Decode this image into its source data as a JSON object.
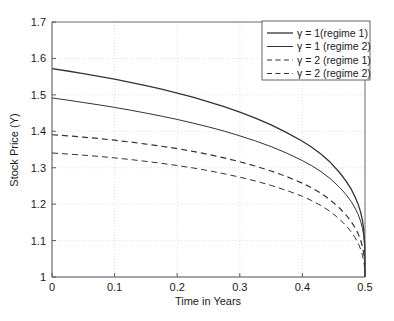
{
  "chart_data": {
    "type": "line",
    "title": "",
    "xlabel": "Time in Years",
    "ylabel": "Stock Price (Y)",
    "xlim": [
      0,
      0.5
    ],
    "ylim": [
      1,
      1.7
    ],
    "xticks": [
      "0",
      "0.1",
      "0.2",
      "0.3",
      "0.4",
      "0.5"
    ],
    "xtick_values": [
      0,
      0.1,
      0.2,
      0.3,
      0.4,
      0.5
    ],
    "yticks": [
      "1",
      "1.1",
      "1.2",
      "1.3",
      "1.4",
      "1.5",
      "1.6",
      "1.7"
    ],
    "ytick_values": [
      1,
      1.1,
      1.2,
      1.3,
      1.4,
      1.5,
      1.6,
      1.7
    ],
    "grid": true,
    "grid_style": "dotted",
    "grid_color": "#d9d9d9",
    "legend_position": "upper right",
    "line_color": "#333333",
    "series": [
      {
        "name": "γ = 1(regime 1)",
        "style": "solid",
        "width": 1.3,
        "x": [
          0,
          0.025,
          0.05,
          0.075,
          0.1,
          0.125,
          0.15,
          0.175,
          0.2,
          0.225,
          0.25,
          0.275,
          0.3,
          0.325,
          0.35,
          0.375,
          0.4,
          0.415,
          0.43,
          0.445,
          0.46,
          0.47,
          0.478,
          0.484,
          0.489,
          0.493,
          0.496,
          0.498,
          0.4995,
          0.5
        ],
        "values": [
          1.572,
          1.5655,
          1.5585,
          1.551,
          1.543,
          1.5345,
          1.5255,
          1.5155,
          1.505,
          1.4935,
          1.481,
          1.4675,
          1.4525,
          1.436,
          1.4175,
          1.3965,
          1.3725,
          1.356,
          1.337,
          1.314,
          1.2855,
          1.2625,
          1.241,
          1.2205,
          1.2,
          1.178,
          1.1545,
          1.13,
          1.09,
          1.0
        ]
      },
      {
        "name": "γ = 1 (regime 2)",
        "style": "solid",
        "width": 1.0,
        "x": [
          0,
          0.025,
          0.05,
          0.075,
          0.1,
          0.125,
          0.15,
          0.175,
          0.2,
          0.225,
          0.25,
          0.275,
          0.3,
          0.325,
          0.35,
          0.375,
          0.4,
          0.415,
          0.43,
          0.445,
          0.46,
          0.47,
          0.478,
          0.484,
          0.489,
          0.493,
          0.496,
          0.498,
          0.4995,
          0.5
        ],
        "values": [
          1.4915,
          1.4855,
          1.479,
          1.4725,
          1.4655,
          1.458,
          1.45,
          1.4415,
          1.4325,
          1.4225,
          1.412,
          1.4005,
          1.3875,
          1.3735,
          1.358,
          1.34,
          1.3195,
          1.3055,
          1.289,
          1.2695,
          1.245,
          1.2255,
          1.207,
          1.1895,
          1.172,
          1.153,
          1.133,
          1.113,
          1.081,
          1.0
        ]
      },
      {
        "name": "γ = 2 (regime 1)",
        "style": "dashed",
        "width": 1.2,
        "x": [
          0,
          0.025,
          0.05,
          0.075,
          0.1,
          0.125,
          0.15,
          0.175,
          0.2,
          0.225,
          0.25,
          0.275,
          0.3,
          0.325,
          0.35,
          0.375,
          0.4,
          0.415,
          0.43,
          0.445,
          0.46,
          0.47,
          0.478,
          0.484,
          0.489,
          0.493,
          0.496,
          0.498,
          0.4995,
          0.5
        ],
        "values": [
          1.3905,
          1.3875,
          1.384,
          1.38,
          1.3755,
          1.3705,
          1.365,
          1.359,
          1.3525,
          1.345,
          1.3365,
          1.327,
          1.3165,
          1.3045,
          1.291,
          1.2755,
          1.2575,
          1.2445,
          1.2295,
          1.211,
          1.188,
          1.1695,
          1.152,
          1.1355,
          1.119,
          1.101,
          1.0825,
          1.064,
          1.04,
          1.0
        ]
      },
      {
        "name": "γ = 2 (regime 2)",
        "style": "dashed",
        "width": 1.0,
        "x": [
          0,
          0.025,
          0.05,
          0.075,
          0.1,
          0.125,
          0.15,
          0.175,
          0.2,
          0.225,
          0.25,
          0.275,
          0.3,
          0.325,
          0.35,
          0.375,
          0.4,
          0.415,
          0.43,
          0.445,
          0.46,
          0.47,
          0.478,
          0.484,
          0.489,
          0.493,
          0.496,
          0.498,
          0.4995,
          0.5
        ],
        "values": [
          1.3405,
          1.3375,
          1.3345,
          1.331,
          1.327,
          1.3225,
          1.3175,
          1.312,
          1.306,
          1.2995,
          1.292,
          1.2835,
          1.274,
          1.2635,
          1.2515,
          1.2375,
          1.2215,
          1.2095,
          1.196,
          1.179,
          1.158,
          1.1405,
          1.124,
          1.1085,
          1.093,
          1.0765,
          1.059,
          1.042,
          1.025,
          1.0
        ]
      }
    ]
  }
}
